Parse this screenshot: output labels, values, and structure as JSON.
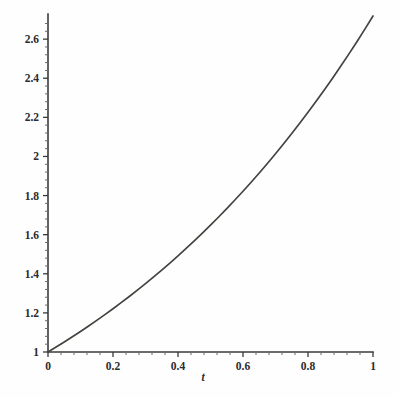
{
  "chart_data": {
    "type": "line",
    "title": "",
    "subtitle": "",
    "xlabel": "t",
    "ylabel": "",
    "xlim": [
      0,
      1
    ],
    "ylim": [
      1,
      2.7183
    ],
    "grid": false,
    "legend": null,
    "function": "y = e^t",
    "x_ticks": [
      "0",
      "0.2",
      "0.4",
      "0.6",
      "0.8",
      "1"
    ],
    "x_tick_values": [
      0,
      0.2,
      0.4,
      0.6,
      0.8,
      1
    ],
    "x_minor_count": 4,
    "y_ticks": [
      "1",
      "1.2",
      "1.4",
      "1.6",
      "1.8",
      "2",
      "2.2",
      "2.4",
      "2.6"
    ],
    "y_tick_values": [
      1,
      1.2,
      1.4,
      1.6,
      1.8,
      2,
      2.2,
      2.4,
      2.6
    ],
    "y_minor_count": 4,
    "series": [
      {
        "name": "e^t",
        "color": "#43433f",
        "x": [
          0,
          0.025,
          0.05,
          0.075,
          0.1,
          0.125,
          0.15,
          0.175,
          0.2,
          0.225,
          0.25,
          0.275,
          0.3,
          0.325,
          0.35,
          0.375,
          0.4,
          0.425,
          0.45,
          0.475,
          0.5,
          0.525,
          0.55,
          0.575,
          0.6,
          0.625,
          0.65,
          0.675,
          0.7,
          0.725,
          0.75,
          0.775,
          0.8,
          0.825,
          0.85,
          0.875,
          0.9,
          0.925,
          0.95,
          0.975,
          1
        ],
        "values": [
          1.0,
          1.0253,
          1.0513,
          1.0779,
          1.1052,
          1.1331,
          1.1618,
          1.1912,
          1.2214,
          1.2523,
          1.284,
          1.3165,
          1.3499,
          1.384,
          1.4191,
          1.455,
          1.4918,
          1.5296,
          1.5683,
          1.608,
          1.6487,
          1.6905,
          1.7333,
          1.7771,
          1.8221,
          1.8682,
          1.9155,
          1.964,
          2.0138,
          2.0648,
          2.117,
          2.1707,
          2.2255,
          2.2819,
          2.3396,
          2.3989,
          2.4596,
          2.5219,
          2.5857,
          2.6512,
          2.7183
        ]
      }
    ],
    "annotations": []
  },
  "axes": {
    "x_axis_name": "horizontal-axis",
    "y_axis_name": "vertical-axis"
  },
  "colors": {
    "curve": "#43433f",
    "axis": "#3a3a3a",
    "text": "#2b2b2b",
    "background": "#fefefe"
  }
}
